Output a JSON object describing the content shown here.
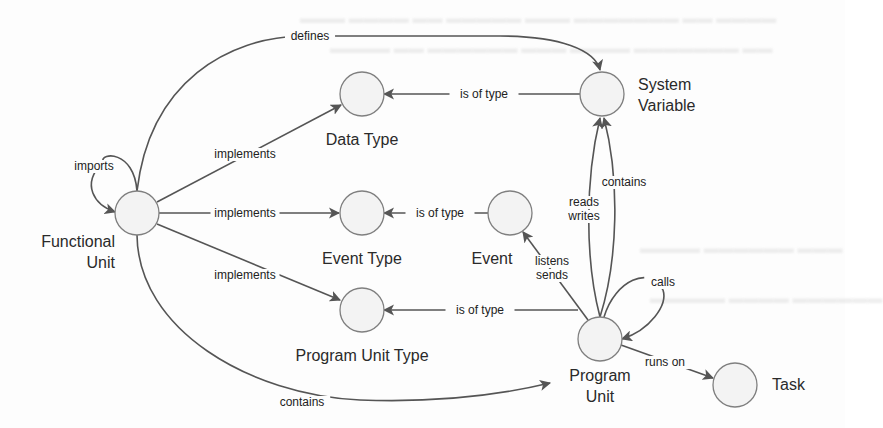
{
  "diagram": {
    "type": "concept-graph",
    "nodes": [
      {
        "id": "functional_unit",
        "label": [
          "Functional",
          "Unit"
        ]
      },
      {
        "id": "data_type",
        "label": [
          "Data Type"
        ]
      },
      {
        "id": "event_type",
        "label": [
          "Event Type"
        ]
      },
      {
        "id": "program_unit_type",
        "label": [
          "Program Unit Type"
        ]
      },
      {
        "id": "event",
        "label": [
          "Event"
        ]
      },
      {
        "id": "system_variable",
        "label": [
          "System",
          "Variable"
        ]
      },
      {
        "id": "program_unit",
        "label": [
          "Program",
          "Unit"
        ]
      },
      {
        "id": "task",
        "label": [
          "Task"
        ]
      }
    ],
    "edges": [
      {
        "id": "fu-imports",
        "from": "functional_unit",
        "to": "functional_unit",
        "label": [
          "imports"
        ]
      },
      {
        "id": "fu-defines-sv",
        "from": "functional_unit",
        "to": "system_variable",
        "label": [
          "defines"
        ]
      },
      {
        "id": "fu-impl-dt",
        "from": "functional_unit",
        "to": "data_type",
        "label": [
          "implements"
        ]
      },
      {
        "id": "fu-impl-et",
        "from": "functional_unit",
        "to": "event_type",
        "label": [
          "implements"
        ]
      },
      {
        "id": "fu-impl-put",
        "from": "functional_unit",
        "to": "program_unit_type",
        "label": [
          "implements"
        ]
      },
      {
        "id": "fu-contains-pu",
        "from": "functional_unit",
        "to": "program_unit",
        "label": [
          "contains"
        ]
      },
      {
        "id": "sv-type-dt",
        "from": "system_variable",
        "to": "data_type",
        "label": [
          "is of type"
        ]
      },
      {
        "id": "ev-type-et",
        "from": "event",
        "to": "event_type",
        "label": [
          "is of type"
        ]
      },
      {
        "id": "pu-type-put",
        "from": "program_unit",
        "to": "program_unit_type",
        "label": [
          "is of type"
        ]
      },
      {
        "id": "pu-rw-sv",
        "from": "program_unit",
        "to": "system_variable",
        "label": [
          "reads",
          "writes"
        ]
      },
      {
        "id": "pu-contains-sv",
        "from": "program_unit",
        "to": "system_variable",
        "label": [
          "contains"
        ]
      },
      {
        "id": "pu-ls-ev",
        "from": "program_unit",
        "to": "event",
        "label": [
          "listens",
          "sends"
        ]
      },
      {
        "id": "pu-calls",
        "from": "program_unit",
        "to": "program_unit",
        "label": [
          "calls"
        ]
      },
      {
        "id": "pu-runs-task",
        "from": "program_unit",
        "to": "task",
        "label": [
          "runs on"
        ]
      }
    ]
  },
  "colors": {
    "edge": "#555555",
    "node_fill": "#f3f3f3",
    "node_stroke": "#7f7f7f",
    "text": "#2a2a2a"
  }
}
